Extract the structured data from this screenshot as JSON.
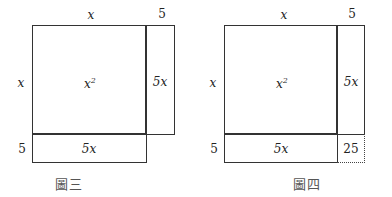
{
  "figures": [
    {
      "caption": "圖三",
      "labels": {
        "top_x": "x",
        "top_5": "5",
        "left_x": "x",
        "left_5": "5",
        "square_base": "x",
        "square_exp": "2",
        "right_rect": "5x",
        "bottom_rect": "5x"
      }
    },
    {
      "caption": "圖四",
      "labels": {
        "top_x": "x",
        "top_5": "5",
        "left_x": "x",
        "left_5": "5",
        "square_base": "x",
        "square_exp": "2",
        "right_rect": "5x",
        "bottom_rect": "5x",
        "corner": "25"
      }
    }
  ]
}
